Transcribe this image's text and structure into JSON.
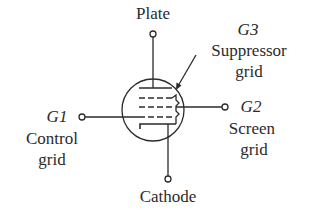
{
  "diagram": {
    "colors": {
      "stroke": "#2b2b2b",
      "background": "#ffffff"
    },
    "labels": {
      "plate": "Plate",
      "g3_id": "G3",
      "g3_name_line1": "Suppressor",
      "g3_name_line2": "grid",
      "g1_id": "G1",
      "g1_name_line1": "Control",
      "g1_name_line2": "grid",
      "g2_id": "G2",
      "g2_name_line1": "Screen",
      "g2_name_line2": "grid",
      "cathode": "Cathode"
    }
  }
}
